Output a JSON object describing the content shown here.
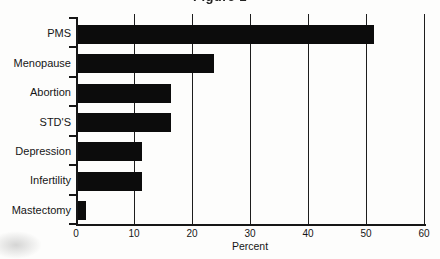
{
  "figure": {
    "background": "#fdfdfc",
    "ink_color": "#141414",
    "bar_color": "#0c0c0c"
  },
  "chart_data": {
    "type": "bar",
    "orientation": "horizontal",
    "title": "Figure 1",
    "categories": [
      "PMS",
      "Menopause",
      "Abortion",
      "STD'S",
      "Depression",
      "Infertility",
      "Mastectomy"
    ],
    "values": [
      51,
      23.5,
      16,
      16,
      11,
      11,
      1.3
    ],
    "xlabel": "Percent",
    "xticks": [
      0,
      10,
      20,
      30,
      40,
      50,
      60
    ],
    "xlim": [
      0,
      60
    ],
    "grid": true,
    "legend": "none"
  }
}
